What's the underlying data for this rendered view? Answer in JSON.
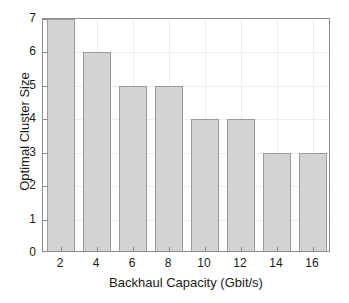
{
  "chart_data": {
    "type": "bar",
    "title": "",
    "xlabel": "Backhaul Capacity (Gbit/s)",
    "ylabel": "Optimal Cluster Size",
    "categories": [
      "2",
      "4",
      "6",
      "8",
      "10",
      "12",
      "14",
      "16"
    ],
    "values": [
      7,
      6,
      5,
      5,
      4,
      4,
      3,
      3
    ],
    "xtick_labels": [
      "2",
      "4",
      "6",
      "8",
      "10",
      "12",
      "14",
      "16"
    ],
    "ytick_labels": [
      "0",
      "1",
      "2",
      "3",
      "4",
      "5",
      "6",
      "7"
    ],
    "yticks": [
      0,
      1,
      2,
      3,
      4,
      5,
      6,
      7
    ],
    "ylim": [
      0,
      7
    ],
    "xlim": [
      1,
      17
    ],
    "grid": true,
    "legend": null,
    "bar_color": "#d3d3d3",
    "bar_edge_color": "#9a9a9a",
    "axis_color": "#8c8c8c",
    "grid_color": "#ededed",
    "text_color": "#1a1a1a",
    "background_color": "#ffffff"
  }
}
